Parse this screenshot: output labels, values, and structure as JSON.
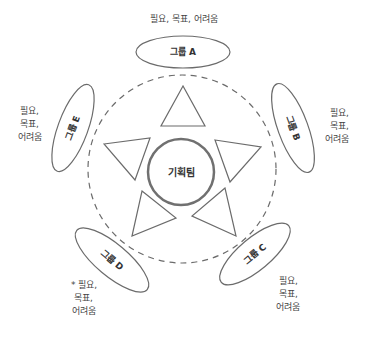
{
  "center": {
    "label": "기획팀"
  },
  "groups": [
    {
      "id": "A",
      "label": "그룹 A",
      "note": [
        "필요, 목표, 어려움"
      ]
    },
    {
      "id": "B",
      "label": "그룹 B",
      "note": [
        "필요,",
        "목표,",
        "어려움"
      ]
    },
    {
      "id": "C",
      "label": "그룹 C",
      "note": [
        "필요,",
        "목표,",
        "어려움"
      ]
    },
    {
      "id": "D",
      "label": "그룹 D",
      "note": [
        "* 필요,",
        "목표,",
        "어려움"
      ]
    },
    {
      "id": "E",
      "label": "그룹 E",
      "note": [
        "필요,",
        "목표,",
        "어려움"
      ]
    }
  ],
  "colors": {
    "stroke": "#6b6b6b",
    "center_stroke": "#707070",
    "text": "#333333"
  }
}
